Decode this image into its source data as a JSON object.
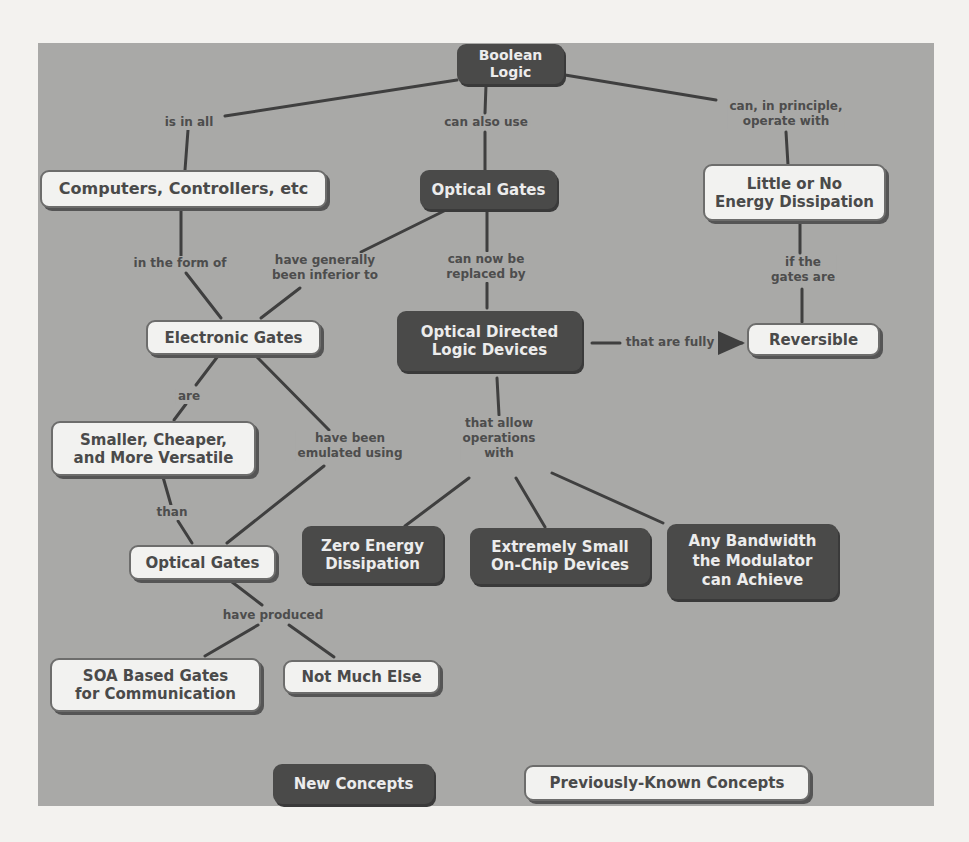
{
  "legend": {
    "new_concepts": "New Concepts",
    "previously_known": "Previously-Known Concepts"
  },
  "colors": {
    "panel_bg": "#a9a9a7",
    "new_concept_fill": "#4a4a49",
    "known_concept_fill": "#f2f2f0",
    "link": "#3f3f3f"
  },
  "nodes": {
    "boolean_logic": "Boolean Logic",
    "computers": "Computers, Controllers, etc",
    "optical_gates_top": "Optical Gates",
    "little_energy": "Little or No\nEnergy Dissipation",
    "electronic_gates": "Electronic Gates",
    "odld": "Optical  Directed\nLogic Devices",
    "reversible": "Reversible",
    "smaller": "Smaller, Cheaper,\nand More Versatile",
    "optical_gates_bottom": "Optical Gates",
    "zero_energy": "Zero Energy\nDissipation",
    "extremely_small": "Extremely Small\nOn-Chip Devices",
    "any_bandwidth": "Any Bandwidth\nthe Modulator\ncan Achieve",
    "soa": "SOA Based Gates\nfor Communication",
    "not_much": "Not Much Else"
  },
  "links": {
    "is_in_all": "is in all",
    "can_also_use": "can also use",
    "can_in_principle": "can, in principle,\noperate with",
    "in_the_form_of": "in the form of",
    "have_generally": "have generally\nbeen inferior to",
    "can_now_be": "can now be\nreplaced by",
    "if_the_gates": "if  the\ngates are",
    "that_are_fully": "that are fully",
    "are": "are",
    "have_been_emulated": "have been\nemulated using",
    "that_allow": "that allow\noperations\nwith",
    "than": "than",
    "have_produced": "have produced"
  }
}
